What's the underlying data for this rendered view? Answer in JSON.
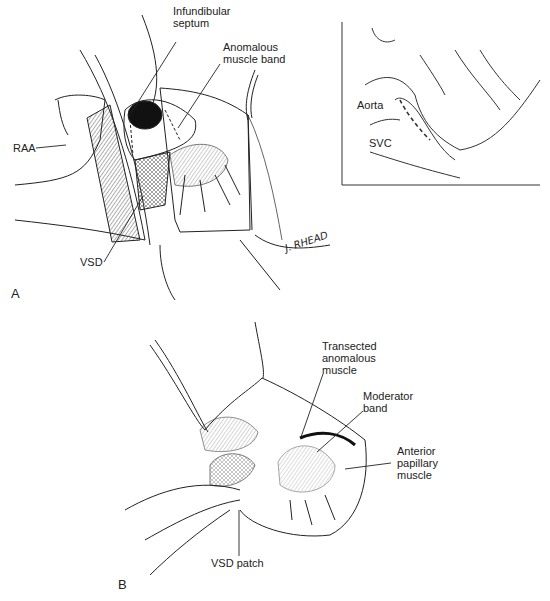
{
  "figure": {
    "panels": [
      {
        "id": "A",
        "label": "A",
        "callouts": {
          "infundibular_septum": "Infundibular\nseptum",
          "anomalous_muscle_band": "Anomalous\nmuscle band",
          "raa": "RAA",
          "vsd": "VSD"
        },
        "signature": "J. RHEAD",
        "inset": {
          "callouts": {
            "aorta": "Aorta",
            "svc": "SVC"
          }
        }
      },
      {
        "id": "B",
        "label": "B",
        "callouts": {
          "transected_anomalous_muscle": "Transected\nanomalous\nmuscle",
          "moderator_band": "Moderator\nband",
          "anterior_papillary_muscle": "Anterior\npapillary\nmuscle",
          "vsd_patch": "VSD patch"
        }
      }
    ],
    "colors": {
      "ink": "#222222",
      "background": "#ffffff",
      "shade": "#333333"
    }
  }
}
